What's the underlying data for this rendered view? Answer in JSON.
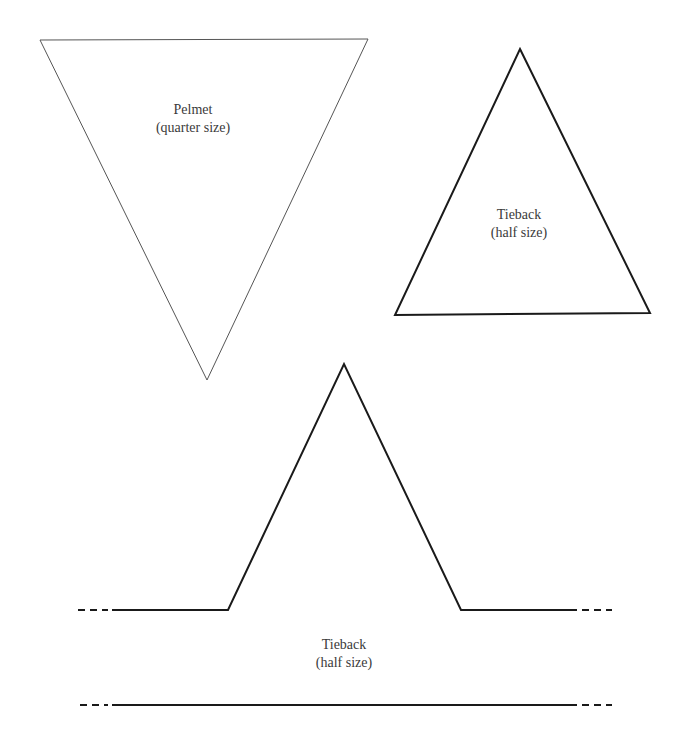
{
  "pieces": {
    "pelmet": {
      "title": "Pelmet",
      "scale": "(quarter size)",
      "shape": "inverted-triangle",
      "points": [
        [
          40,
          40
        ],
        [
          368,
          39
        ],
        [
          207,
          380
        ]
      ],
      "stroke": "#555555",
      "stroke_width": 1
    },
    "tieback_triangle": {
      "title": "Tieback",
      "scale": "(half size)",
      "shape": "triangle",
      "points": [
        [
          520,
          49
        ],
        [
          650,
          313
        ],
        [
          395,
          315
        ]
      ],
      "stroke": "#1a1a1a",
      "stroke_width": 2
    },
    "tieback_strip": {
      "title": "Tieback",
      "scale": "(half size)",
      "shape": "strip-with-peak",
      "profile_points": [
        [
          112,
          610
        ],
        [
          228,
          610
        ],
        [
          344,
          364
        ],
        [
          461,
          610
        ],
        [
          577,
          610
        ]
      ],
      "baseline_y": 705,
      "baseline_x": [
        112,
        577
      ],
      "dashed_left_x": [
        78,
        108
      ],
      "dashed_right_x": [
        582,
        612
      ],
      "stroke": "#1a1a1a",
      "stroke_width": 2
    }
  },
  "colors": {
    "background": "#ffffff",
    "text": "#3a3a3a"
  }
}
